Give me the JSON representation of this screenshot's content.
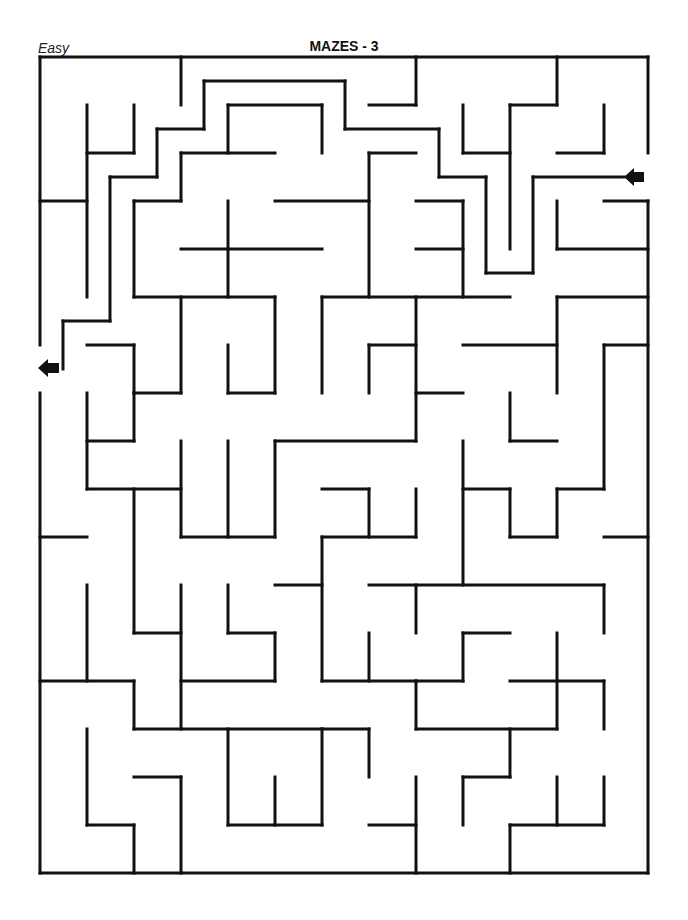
{
  "header": {
    "difficulty": "Easy",
    "title": "MAZES - 3"
  },
  "maze": {
    "wall_color": "#111111",
    "entrance_arrow": {
      "side": "right",
      "x": 636,
      "y": 177,
      "direction": "left"
    },
    "exit_arrow": {
      "side": "left",
      "x": 48,
      "y": 368,
      "direction": "left"
    },
    "walls": [
      [
        40,
        57,
        648,
        57
      ],
      [
        40,
        57,
        40,
        345
      ],
      [
        40,
        393,
        40,
        873
      ],
      [
        40,
        873,
        648,
        873
      ],
      [
        648,
        57,
        648,
        153
      ],
      [
        648,
        201,
        648,
        873
      ],
      [
        181,
        57,
        181,
        105
      ],
      [
        416,
        57,
        416,
        105
      ],
      [
        369,
        105,
        416,
        105
      ],
      [
        557,
        57,
        557,
        105
      ],
      [
        510,
        105,
        557,
        105
      ],
      [
        510,
        105,
        510,
        249
      ],
      [
        87,
        105,
        87,
        297
      ],
      [
        87,
        153,
        134,
        153
      ],
      [
        134,
        105,
        134,
        153
      ],
      [
        40,
        201,
        87,
        201
      ],
      [
        204,
        81,
        345,
        81
      ],
      [
        204,
        81,
        204,
        129
      ],
      [
        157,
        129,
        204,
        129
      ],
      [
        157,
        129,
        157,
        177
      ],
      [
        110,
        177,
        157,
        177
      ],
      [
        110,
        177,
        110,
        321
      ],
      [
        63,
        321,
        110,
        321
      ],
      [
        63,
        321,
        63,
        369
      ],
      [
        345,
        81,
        345,
        129
      ],
      [
        345,
        129,
        439,
        129
      ],
      [
        439,
        129,
        439,
        177
      ],
      [
        439,
        177,
        486,
        177
      ],
      [
        486,
        177,
        486,
        273
      ],
      [
        486,
        273,
        533,
        273
      ],
      [
        533,
        177,
        533,
        273
      ],
      [
        533,
        177,
        624,
        177
      ],
      [
        228,
        105,
        322,
        105
      ],
      [
        228,
        105,
        228,
        153
      ],
      [
        322,
        105,
        322,
        153
      ],
      [
        181,
        153,
        181,
        201
      ],
      [
        181,
        153,
        275,
        153
      ],
      [
        134,
        201,
        181,
        201
      ],
      [
        134,
        201,
        134,
        297
      ],
      [
        463,
        105,
        463,
        153
      ],
      [
        463,
        153,
        510,
        153
      ],
      [
        604,
        105,
        604,
        153
      ],
      [
        557,
        153,
        604,
        153
      ],
      [
        369,
        153,
        416,
        153
      ],
      [
        369,
        153,
        369,
        297
      ],
      [
        275,
        201,
        369,
        201
      ],
      [
        416,
        201,
        463,
        201
      ],
      [
        463,
        201,
        463,
        297
      ],
      [
        416,
        249,
        463,
        249
      ],
      [
        181,
        249,
        322,
        249
      ],
      [
        228,
        201,
        228,
        297
      ],
      [
        134,
        297,
        275,
        297
      ],
      [
        181,
        297,
        181,
        393
      ],
      [
        275,
        297,
        275,
        393
      ],
      [
        228,
        345,
        228,
        393
      ],
      [
        228,
        393,
        275,
        393
      ],
      [
        322,
        297,
        322,
        393
      ],
      [
        322,
        297,
        510,
        297
      ],
      [
        416,
        297,
        416,
        441
      ],
      [
        369,
        345,
        416,
        345
      ],
      [
        369,
        345,
        369,
        393
      ],
      [
        416,
        393,
        463,
        393
      ],
      [
        557,
        201,
        557,
        249
      ],
      [
        557,
        249,
        648,
        249
      ],
      [
        604,
        201,
        648,
        201
      ],
      [
        557,
        297,
        648,
        297
      ],
      [
        557,
        297,
        557,
        393
      ],
      [
        463,
        345,
        557,
        345
      ],
      [
        604,
        345,
        648,
        345
      ],
      [
        604,
        345,
        604,
        489
      ],
      [
        557,
        489,
        604,
        489
      ],
      [
        557,
        489,
        557,
        537
      ],
      [
        510,
        537,
        557,
        537
      ],
      [
        510,
        489,
        510,
        537
      ],
      [
        463,
        489,
        510,
        489
      ],
      [
        463,
        441,
        463,
        585
      ],
      [
        510,
        393,
        510,
        441
      ],
      [
        510,
        441,
        557,
        441
      ],
      [
        87,
        345,
        134,
        345
      ],
      [
        134,
        345,
        134,
        393
      ],
      [
        134,
        393,
        181,
        393
      ],
      [
        87,
        393,
        87,
        489
      ],
      [
        87,
        441,
        134,
        441
      ],
      [
        134,
        393,
        134,
        441
      ],
      [
        87,
        489,
        181,
        489
      ],
      [
        275,
        441,
        416,
        441
      ],
      [
        275,
        441,
        275,
        537
      ],
      [
        181,
        441,
        181,
        537
      ],
      [
        228,
        441,
        228,
        537
      ],
      [
        181,
        537,
        275,
        537
      ],
      [
        322,
        489,
        369,
        489
      ],
      [
        369,
        489,
        369,
        537
      ],
      [
        416,
        489,
        416,
        537
      ],
      [
        322,
        537,
        416,
        537
      ],
      [
        322,
        537,
        322,
        681
      ],
      [
        275,
        585,
        322,
        585
      ],
      [
        134,
        489,
        134,
        633
      ],
      [
        134,
        633,
        181,
        633
      ],
      [
        181,
        585,
        181,
        729
      ],
      [
        228,
        585,
        228,
        633
      ],
      [
        228,
        633,
        275,
        633
      ],
      [
        275,
        633,
        275,
        681
      ],
      [
        181,
        681,
        275,
        681
      ],
      [
        40,
        537,
        87,
        537
      ],
      [
        87,
        585,
        87,
        681
      ],
      [
        40,
        681,
        134,
        681
      ],
      [
        134,
        681,
        134,
        729
      ],
      [
        134,
        729,
        322,
        729
      ],
      [
        369,
        585,
        604,
        585
      ],
      [
        416,
        585,
        416,
        633
      ],
      [
        604,
        585,
        604,
        633
      ],
      [
        604,
        537,
        648,
        537
      ],
      [
        369,
        633,
        369,
        681
      ],
      [
        322,
        681,
        416,
        681
      ],
      [
        463,
        633,
        510,
        633
      ],
      [
        463,
        633,
        463,
        681
      ],
      [
        416,
        681,
        463,
        681
      ],
      [
        416,
        681,
        416,
        729
      ],
      [
        416,
        729,
        557,
        729
      ],
      [
        557,
        633,
        557,
        729
      ],
      [
        510,
        681,
        604,
        681
      ],
      [
        604,
        681,
        604,
        729
      ],
      [
        228,
        729,
        228,
        825
      ],
      [
        228,
        825,
        322,
        825
      ],
      [
        275,
        777,
        275,
        825
      ],
      [
        322,
        729,
        322,
        825
      ],
      [
        322,
        729,
        369,
        729
      ],
      [
        369,
        729,
        369,
        777
      ],
      [
        87,
        729,
        87,
        825
      ],
      [
        87,
        825,
        134,
        825
      ],
      [
        134,
        825,
        134,
        873
      ],
      [
        134,
        777,
        181,
        777
      ],
      [
        181,
        777,
        181,
        873
      ],
      [
        369,
        825,
        416,
        825
      ],
      [
        416,
        777,
        416,
        873
      ],
      [
        463,
        777,
        463,
        825
      ],
      [
        463,
        777,
        510,
        777
      ],
      [
        510,
        729,
        510,
        777
      ],
      [
        510,
        825,
        604,
        825
      ],
      [
        510,
        825,
        510,
        873
      ],
      [
        557,
        777,
        557,
        825
      ],
      [
        604,
        777,
        604,
        825
      ]
    ]
  }
}
